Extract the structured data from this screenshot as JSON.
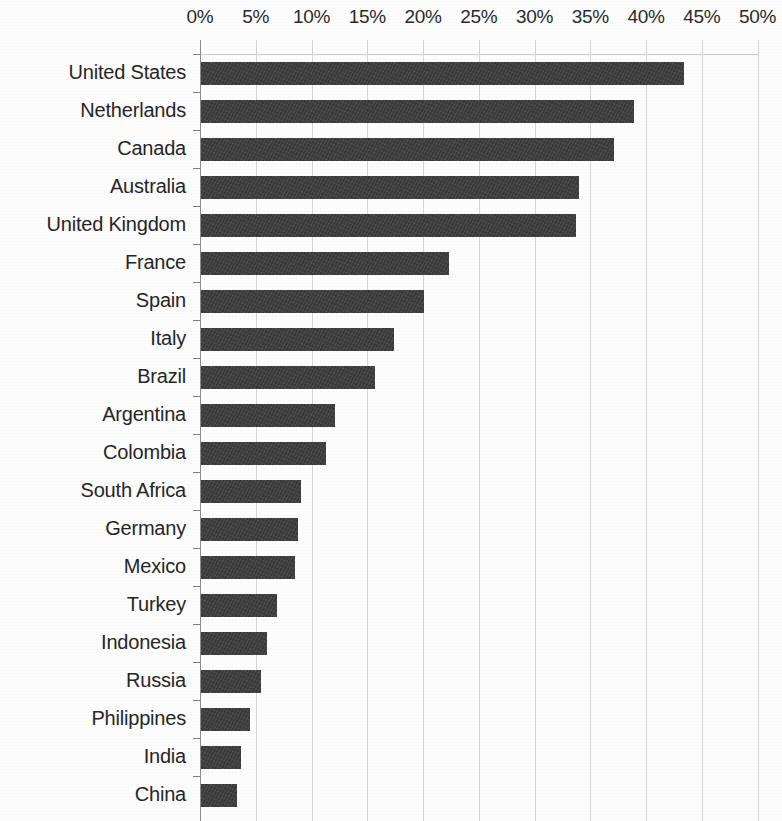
{
  "chart_data": {
    "type": "bar",
    "orientation": "horizontal",
    "title": "",
    "subtitle": "",
    "xlabel": "",
    "ylabel": "",
    "xlim": [
      0,
      50
    ],
    "ylim": null,
    "grid": true,
    "legend": null,
    "legend_position": "none",
    "value_unit": "%",
    "xtick_labels": [
      "0%",
      "5%",
      "10%",
      "15%",
      "20%",
      "25%",
      "30%",
      "35%",
      "40%",
      "45%",
      "50%"
    ],
    "xticks": [
      0,
      5,
      10,
      15,
      20,
      25,
      30,
      35,
      40,
      45,
      50
    ],
    "categories": [
      "United States",
      "Netherlands",
      "Canada",
      "Australia",
      "United Kingdom",
      "France",
      "Spain",
      "Italy",
      "Brazil",
      "Argentina",
      "Colombia",
      "South Africa",
      "Germany",
      "Mexico",
      "Turkey",
      "Indonesia",
      "Russia",
      "Philippines",
      "India",
      "China"
    ],
    "values": [
      43.3,
      38.8,
      37.0,
      33.9,
      33.6,
      22.2,
      20.0,
      17.3,
      15.6,
      12.0,
      11.2,
      9.0,
      8.7,
      8.4,
      6.8,
      5.9,
      5.4,
      4.4,
      3.6,
      3.2
    ],
    "series": [
      {
        "name": "Share",
        "color": "#3a3a3a",
        "values": [
          43.3,
          38.8,
          37.0,
          33.9,
          33.6,
          22.2,
          20.0,
          17.3,
          15.6,
          12.0,
          11.2,
          9.0,
          8.7,
          8.4,
          6.8,
          5.9,
          5.4,
          4.4,
          3.6,
          3.2
        ]
      }
    ]
  },
  "style": {
    "bar_color": "#3a3a3a",
    "grid_color": "#d6d6d6",
    "axis_color": "#8c8c8c",
    "text_color": "#262626",
    "background": "#fdfdfd"
  }
}
